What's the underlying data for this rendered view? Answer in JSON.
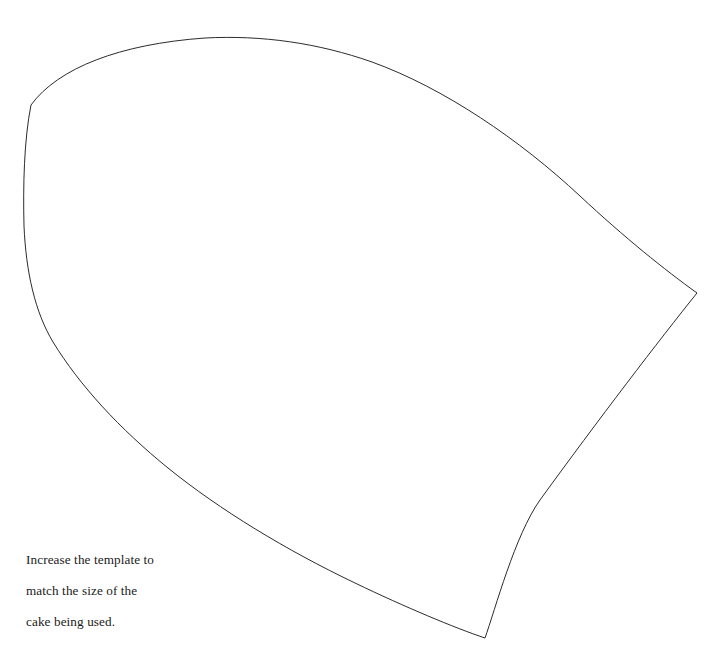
{
  "document": {
    "kind": "printable-template-diagram",
    "title": "Cake Template",
    "background_color": "#ffffff"
  },
  "canvas": {
    "width": 720,
    "height": 665
  },
  "shape": {
    "name": "cake-template-outline",
    "description": "Curved quadrilateral template outline (wedge / shield-like shape)",
    "stroke_color": "#2b2b2b",
    "stroke_width": 1,
    "fill": "none",
    "vertices": [
      {
        "label": "top-left-corner",
        "x": 31,
        "y": 105
      },
      {
        "label": "right-corner",
        "x": 697,
        "y": 293
      },
      {
        "label": "bottom-corner",
        "x": 485,
        "y": 638
      }
    ],
    "path": "M 31,105 C 58,68 120,44 205,38 C 262,35 318,43 372,62 C 444,88 520,140 580,196 C 625,238 665,270 697,293 C 660,339 598,420 540,500 C 515,535 495,610 485,638 C 455,628 405,607 355,583 C 286,550 220,510 168,468 C 120,429 80,386 53,342 C 35,312 26,272 24,226 C 23,186 24,140 31,105 Z",
    "path_top_edge": "M 31,105 C 58,68 120,44 205,38 C 262,35 318,43 372,62 C 444,88 520,140 580,196 C 625,238 665,270 697,293",
    "path_right_edge": "M 697,293 C 660,340 598,421 540,500 C 514,536 494,611 485,638",
    "path_bottom_edge": "M 485,638 C 452,627 402,605 352,581 C 284,548 218,508 166,466 C 118,427 79,384 52,340",
    "path_left_edge": "M 52,340 C 34,310 26,271 24,226 C 23,185 24,139 31,105"
  },
  "caption": {
    "name": "instruction-caption",
    "lines": [
      "Increase the template to",
      "match the size of the",
      "cake being used."
    ],
    "full_text": "Increase the template to match the size of the cake being used.",
    "color": "#1a1a1a",
    "position": {
      "x": 26,
      "y": 536
    }
  }
}
